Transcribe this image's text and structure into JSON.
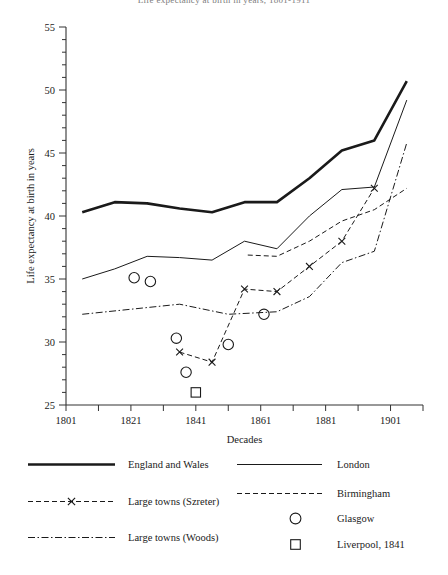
{
  "figure": {
    "top_fragment": "Life expectancy at birth in years, 1801-1911",
    "axes": {
      "y": {
        "title": "Life expectancy at birth in years",
        "min": 25,
        "max": 55,
        "major_step": 5,
        "minor_step": 1,
        "ticks": [
          25,
          30,
          35,
          40,
          45,
          50,
          55
        ]
      },
      "x": {
        "title": "Decades",
        "min": 1801,
        "max": 1911,
        "major_step": 20,
        "minor_step": 10,
        "ticks": [
          1801,
          1811,
          1821,
          1831,
          1841,
          1851,
          1861,
          1871,
          1881,
          1891,
          1901,
          1911
        ],
        "labelled_ticks": [
          1801,
          1821,
          1841,
          1861,
          1881,
          1901
        ]
      }
    }
  },
  "legend": {
    "entries": [
      {
        "label": "England and Wales",
        "style": "thick-solid",
        "column": "left"
      },
      {
        "label": "Large towns (Szreter)",
        "style": "dashed-cross",
        "column": "left"
      },
      {
        "label": "Large towns (Woods)",
        "style": "dash-dot",
        "column": "left"
      },
      {
        "label": "London",
        "style": "thin-solid",
        "column": "right"
      },
      {
        "label": "Birmingham",
        "style": "dashed",
        "column": "right"
      },
      {
        "label": "Glasgow",
        "style": "circle-marker",
        "column": "right"
      },
      {
        "label": "Liverpool, 1841",
        "style": "square-marker",
        "column": "right"
      }
    ]
  },
  "colors": {
    "ink": "#1a1a1a",
    "axis": "#333333",
    "background": "#ffffff"
  },
  "chart_data": {
    "type": "line",
    "title": "",
    "xlabel": "Decades",
    "ylabel": "Life expectancy at birth in years",
    "xlim": [
      1801,
      1911
    ],
    "ylim": [
      25,
      55
    ],
    "grid": false,
    "legend_position": "below",
    "series": [
      {
        "name": "England and Wales",
        "style": "thick-solid",
        "x": [
          1806,
          1816,
          1826,
          1836,
          1846,
          1856,
          1866,
          1876,
          1886,
          1896,
          1906
        ],
        "values": [
          40.3,
          41.1,
          41.0,
          40.6,
          40.3,
          41.1,
          41.1,
          43.0,
          45.2,
          46.0,
          50.7
        ]
      },
      {
        "name": "London",
        "style": "thin-solid",
        "x": [
          1806,
          1816,
          1826,
          1836,
          1846,
          1856,
          1866,
          1876,
          1886,
          1896,
          1906
        ],
        "values": [
          35.0,
          35.8,
          36.8,
          36.7,
          36.5,
          38.0,
          37.4,
          40.0,
          42.1,
          42.3,
          49.2
        ]
      },
      {
        "name": "Large towns (Szreter)",
        "style": "dashed-cross",
        "x": [
          1836,
          1846,
          1856,
          1866,
          1876,
          1886,
          1896
        ],
        "values": [
          29.2,
          28.4,
          34.2,
          34.0,
          36.0,
          38.0,
          42.2
        ],
        "markers": "x"
      },
      {
        "name": "Birmingham",
        "style": "dashed",
        "x": [
          1857,
          1866,
          1876,
          1886,
          1896,
          1906
        ],
        "values": [
          36.9,
          36.8,
          38.0,
          39.6,
          40.5,
          42.2
        ]
      },
      {
        "name": "Large towns (Woods)",
        "style": "dash-dot",
        "x": [
          1806,
          1821,
          1836,
          1851,
          1866,
          1876,
          1886,
          1896,
          1906
        ],
        "values": [
          32.2,
          32.6,
          33.0,
          32.2,
          32.4,
          33.6,
          36.3,
          37.2,
          45.8
        ]
      }
    ],
    "points": [
      {
        "name": "Glasgow",
        "marker": "circle",
        "x": 1822,
        "y": 35.1
      },
      {
        "name": "Glasgow",
        "marker": "circle",
        "x": 1827,
        "y": 34.8
      },
      {
        "name": "Glasgow",
        "marker": "circle",
        "x": 1835,
        "y": 30.3
      },
      {
        "name": "Glasgow",
        "marker": "circle",
        "x": 1838,
        "y": 27.6
      },
      {
        "name": "Glasgow",
        "marker": "circle",
        "x": 1851,
        "y": 29.8
      },
      {
        "name": "Glasgow",
        "marker": "circle",
        "x": 1862,
        "y": 32.2
      },
      {
        "name": "Liverpool, 1841",
        "marker": "square",
        "x": 1841,
        "y": 26.0
      }
    ]
  }
}
